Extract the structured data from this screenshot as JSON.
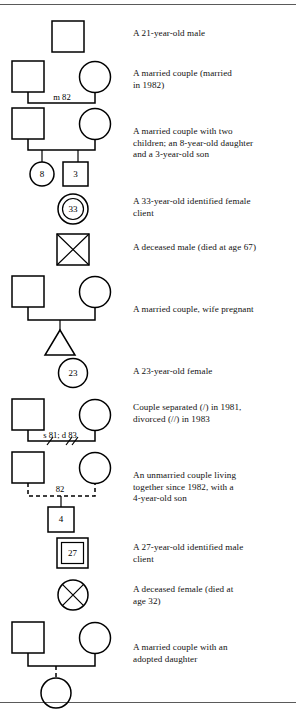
{
  "document": {
    "type": "genogram-symbol-legend",
    "top_rule": true,
    "bottom_rule": true
  },
  "rows": [
    {
      "id": "single-male",
      "description_lines": [
        "A 21-year-old male"
      ],
      "symbols": [
        {
          "shape": "square",
          "label": "",
          "name": "male-square"
        }
      ]
    },
    {
      "id": "married-couple",
      "description_lines": [
        "A married couple (married",
        "in 1982)"
      ],
      "link_label": "m 82",
      "symbols": [
        {
          "shape": "square",
          "label": "",
          "name": "husband-square"
        },
        {
          "shape": "circle",
          "label": "",
          "name": "wife-circle"
        }
      ]
    },
    {
      "id": "married-couple-two-children",
      "description_lines": [
        "A married couple with two",
        "children; an 8-year-old daughter",
        "and a 3-year-old son"
      ],
      "symbols": [
        {
          "shape": "square",
          "label": "",
          "name": "father-square"
        },
        {
          "shape": "circle",
          "label": "",
          "name": "mother-circle"
        },
        {
          "shape": "circle",
          "label": "8",
          "name": "daughter-circle"
        },
        {
          "shape": "square",
          "label": "3",
          "name": "son-square"
        }
      ]
    },
    {
      "id": "identified-female-client",
      "description_lines": [
        "A 33-year-old identified female",
        "client"
      ],
      "symbols": [
        {
          "shape": "double-circle",
          "label": "33",
          "name": "identified-female-client-symbol"
        }
      ]
    },
    {
      "id": "deceased-male",
      "description_lines": [
        "A deceased male (died at age 67)"
      ],
      "symbols": [
        {
          "shape": "crossed-square",
          "label": "",
          "name": "deceased-male-symbol"
        }
      ]
    },
    {
      "id": "married-couple-pregnant",
      "description_lines": [
        "A married couple, wife pregnant"
      ],
      "symbols": [
        {
          "shape": "square",
          "label": "",
          "name": "husband-square"
        },
        {
          "shape": "circle",
          "label": "",
          "name": "wife-circle"
        },
        {
          "shape": "triangle",
          "label": "",
          "name": "pregnancy-triangle"
        }
      ]
    },
    {
      "id": "single-female",
      "description_lines": [
        "A 23-year-old female"
      ],
      "symbols": [
        {
          "shape": "circle",
          "label": "23",
          "name": "female-circle"
        }
      ]
    },
    {
      "id": "separated-divorced-couple",
      "description_lines": [
        "Couple separated (/) in 1981,",
        "divorced (//) in 1983"
      ],
      "link_label": "s 81; d 83",
      "symbols": [
        {
          "shape": "square",
          "label": "",
          "name": "husband-square"
        },
        {
          "shape": "circle",
          "label": "",
          "name": "wife-circle"
        }
      ]
    },
    {
      "id": "unmarried-couple-with-son",
      "description_lines": [
        "An unmarried couple living",
        "together since 1982, with a",
        "4-year-old son"
      ],
      "link_label": "82",
      "symbols": [
        {
          "shape": "square",
          "label": "",
          "name": "partner-square"
        },
        {
          "shape": "circle",
          "label": "",
          "name": "partner-circle"
        },
        {
          "shape": "square",
          "label": "4",
          "name": "son-square"
        }
      ]
    },
    {
      "id": "identified-male-client",
      "description_lines": [
        "A 27-year-old identified male",
        "client"
      ],
      "symbols": [
        {
          "shape": "double-square",
          "label": "27",
          "name": "identified-male-client-symbol"
        }
      ]
    },
    {
      "id": "deceased-female",
      "description_lines": [
        "A deceased female (died at",
        "age 32)"
      ],
      "symbols": [
        {
          "shape": "crossed-circle",
          "label": "",
          "name": "deceased-female-symbol"
        }
      ]
    },
    {
      "id": "married-couple-adopted-daughter",
      "description_lines": [
        "A married couple with an",
        "adopted daughter"
      ],
      "symbols": [
        {
          "shape": "square",
          "label": "",
          "name": "father-square"
        },
        {
          "shape": "circle",
          "label": "",
          "name": "mother-circle"
        },
        {
          "shape": "circle",
          "label": "",
          "name": "adopted-daughter-circle"
        }
      ]
    }
  ]
}
